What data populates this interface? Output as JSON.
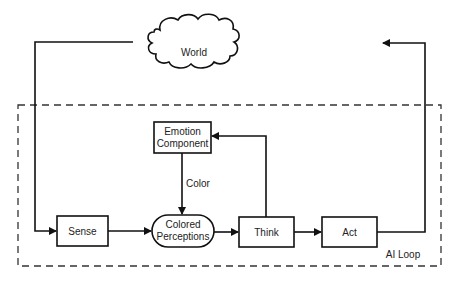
{
  "diagram": {
    "container_label": "AI Loop",
    "nodes": {
      "world": {
        "label": "World",
        "shape": "cloud"
      },
      "emotion": {
        "label_line1": "Emotion",
        "label_line2": "Component",
        "shape": "rectangle"
      },
      "sense": {
        "label": "Sense",
        "shape": "rectangle"
      },
      "perceptions": {
        "label_line1": "Colored",
        "label_line2": "Perceptions",
        "shape": "rounded-pill"
      },
      "think": {
        "label": "Think",
        "shape": "rectangle"
      },
      "act": {
        "label": "Act",
        "shape": "rectangle"
      }
    },
    "edges": [
      {
        "from": "World",
        "to": "Sense",
        "label": ""
      },
      {
        "from": "Sense",
        "to": "Colored Perceptions",
        "label": ""
      },
      {
        "from": "Emotion Component",
        "to": "Colored Perceptions",
        "label": "Color"
      },
      {
        "from": "Colored Perceptions",
        "to": "Think",
        "label": ""
      },
      {
        "from": "Think",
        "to": "Emotion Component",
        "label": ""
      },
      {
        "from": "Think",
        "to": "Act",
        "label": ""
      },
      {
        "from": "Act",
        "to": "World",
        "label": ""
      }
    ],
    "edge_labels": {
      "color": "Color"
    },
    "colors": {
      "stroke": "#111111",
      "dash": "#333333",
      "background": "#ffffff"
    }
  }
}
